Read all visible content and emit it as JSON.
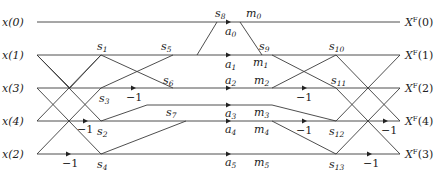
{
  "inputs": [
    "x(0)",
    "x(1)",
    "x(3)",
    "x(4)",
    "x(2)"
  ],
  "outputs": [
    "Xᶠ(0)",
    "Xᶠ(1)",
    "Xᶠ(2)",
    "Xᶠ(4)",
    "Xᶠ(3)"
  ],
  "output_labels": {
    "o0": {
      "base": "X",
      "sup": "F",
      "arg": "(0)"
    },
    "o1": {
      "base": "X",
      "sup": "F",
      "arg": "(1)"
    },
    "o2": {
      "base": "X",
      "sup": "F",
      "arg": "(2)"
    },
    "o3": {
      "base": "X",
      "sup": "F",
      "arg": "(4)"
    },
    "o4": {
      "base": "X",
      "sup": "F",
      "arg": "(3)"
    }
  },
  "nodes": {
    "s1": {
      "base": "s",
      "sub": "1"
    },
    "s2": {
      "base": "s",
      "sub": "2"
    },
    "s3": {
      "base": "s",
      "sub": "3"
    },
    "s4": {
      "base": "s",
      "sub": "4"
    },
    "s5": {
      "base": "s",
      "sub": "5"
    },
    "s6": {
      "base": "s",
      "sub": "6"
    },
    "s7": {
      "base": "s",
      "sub": "7"
    },
    "s8": {
      "base": "s",
      "sub": "8"
    },
    "s9": {
      "base": "s",
      "sub": "9"
    },
    "s10": {
      "base": "s",
      "sub": "10"
    },
    "s11": {
      "base": "s",
      "sub": "11"
    },
    "s12": {
      "base": "s",
      "sub": "12"
    },
    "s13": {
      "base": "s",
      "sub": "13"
    }
  },
  "multipliers": {
    "a0": {
      "base": "a",
      "sub": "0"
    },
    "a1": {
      "base": "a",
      "sub": "1"
    },
    "a2": {
      "base": "a",
      "sub": "2"
    },
    "a3": {
      "base": "a",
      "sub": "3"
    },
    "a4": {
      "base": "a",
      "sub": "4"
    },
    "a5": {
      "base": "a",
      "sub": "5"
    }
  },
  "products": {
    "m0": {
      "base": "m",
      "sub": "0"
    },
    "m1": {
      "base": "m",
      "sub": "1"
    },
    "m2": {
      "base": "m",
      "sub": "2"
    },
    "m3": {
      "base": "m",
      "sub": "3"
    },
    "m4": {
      "base": "m",
      "sub": "4"
    },
    "m5": {
      "base": "m",
      "sub": "5"
    }
  },
  "neg_label": "−1"
}
